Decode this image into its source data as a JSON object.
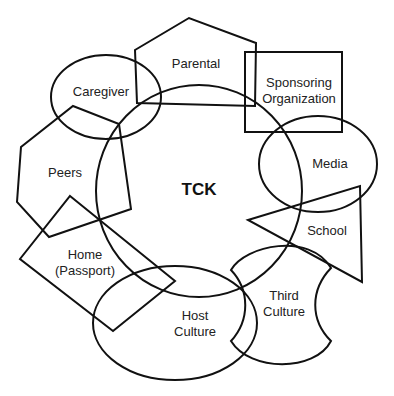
{
  "diagram": {
    "center": {
      "label": "TCK"
    },
    "nodes": [
      {
        "id": "caregiver",
        "shape": "ellipse",
        "lines": [
          "Caregiver"
        ]
      },
      {
        "id": "parental",
        "shape": "pentagon",
        "lines": [
          "Parental"
        ]
      },
      {
        "id": "sponsoring",
        "shape": "rectangle",
        "lines": [
          "Sponsoring",
          "Organization"
        ]
      },
      {
        "id": "media",
        "shape": "ellipse",
        "lines": [
          "Media"
        ]
      },
      {
        "id": "school",
        "shape": "triangle",
        "lines": [
          "School"
        ]
      },
      {
        "id": "third-culture",
        "shape": "notched-blob",
        "lines": [
          "Third",
          "Culture"
        ]
      },
      {
        "id": "host-culture",
        "shape": "ellipse",
        "lines": [
          "Host",
          "Culture"
        ]
      },
      {
        "id": "home",
        "shape": "rotated-rectangle",
        "lines": [
          "Home",
          "(Passport)"
        ]
      },
      {
        "id": "peers",
        "shape": "hexagon",
        "lines": [
          "Peers"
        ]
      }
    ]
  }
}
